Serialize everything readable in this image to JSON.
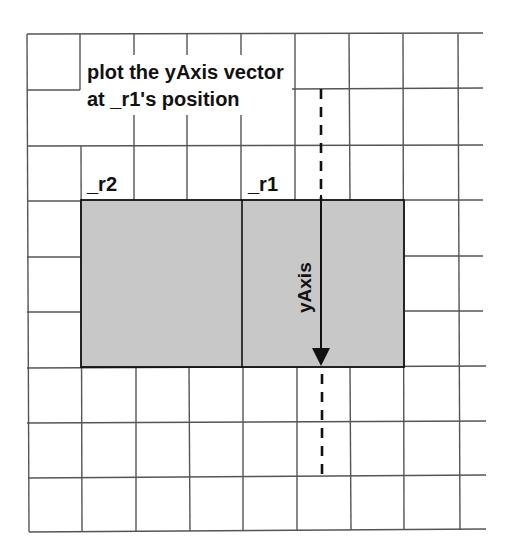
{
  "diagram": {
    "annotation_line1": "plot the yAxis vector",
    "annotation_line2": "at _r1's position",
    "label_r2": "_r2",
    "label_r1": "_r1",
    "vector_label": "yAxis",
    "colors": {
      "grid": "#555555",
      "rect_fill": "#c8c8c8",
      "rect_stroke": "#111111",
      "arrow": "#111111"
    }
  }
}
